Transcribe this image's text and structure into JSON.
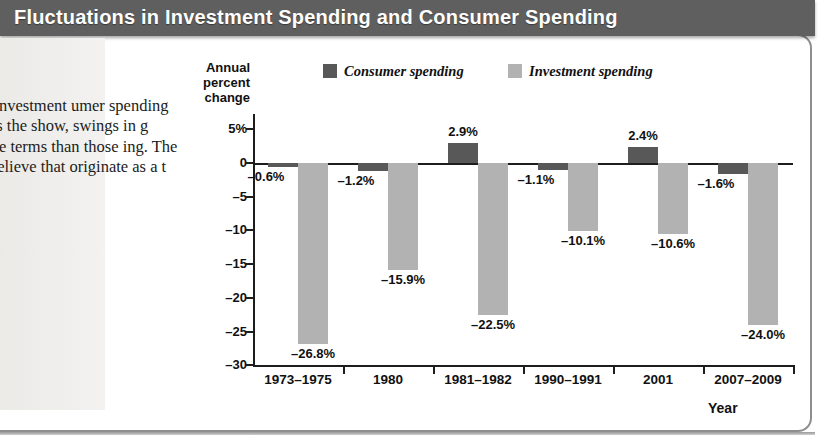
{
  "title": "Fluctuations in Investment Spending and Consumer Spending",
  "caption": "the annual investment umer spending cessions. As the show, swings in g were much e terms than those ing. The pattern to believe that originate as a t spending.",
  "x_axis_title": "Year",
  "colors": {
    "title_bar": "#5f5f5f",
    "consumer": "#585858",
    "investment": "#b2b2b2",
    "axis": "#1d1d1d",
    "caption_panel": "#eceae7"
  },
  "chart_data": {
    "type": "bar",
    "title": "Fluctuations in Investment Spending and Consumer Spending",
    "xlabel": "Year",
    "ylabel": "Annual percent change",
    "ylim": [
      -30,
      5
    ],
    "yticks": [
      "5%",
      "0",
      "–5",
      "–10",
      "–15",
      "–20",
      "–25",
      "–30"
    ],
    "ytick_values": [
      5,
      0,
      -5,
      -10,
      -15,
      -20,
      -25,
      -30
    ],
    "grid": false,
    "legend_position": "top",
    "categories": [
      "1973–1975",
      "1980",
      "1981–1982",
      "1990–1991",
      "2001",
      "2007–2009"
    ],
    "series": [
      {
        "name": "Consumer spending",
        "color": "#585858",
        "values": [
          -0.6,
          -1.2,
          2.9,
          -1.1,
          2.4,
          -1.6
        ],
        "labels": [
          "–0.6%",
          "–1.2%",
          "2.9%",
          "–1.1%",
          "2.4%",
          "–1.6%"
        ]
      },
      {
        "name": "Investment spending",
        "color": "#b2b2b2",
        "values": [
          -26.8,
          -15.9,
          -22.5,
          -10.1,
          -10.6,
          -24.0
        ],
        "labels": [
          "–26.8%",
          "–15.9%",
          "–22.5%",
          "–10.1%",
          "–10.6%",
          "–24.0%"
        ]
      }
    ]
  }
}
